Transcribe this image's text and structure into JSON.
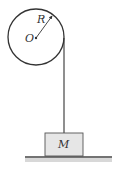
{
  "diagram": {
    "type": "pulley-mass",
    "pulley": {
      "center_label": "O",
      "radius_label": "R"
    },
    "block": {
      "label": "M",
      "fill": "#e6e6e6"
    },
    "colors": {
      "stroke": "#333333",
      "ground": "#555555"
    }
  }
}
